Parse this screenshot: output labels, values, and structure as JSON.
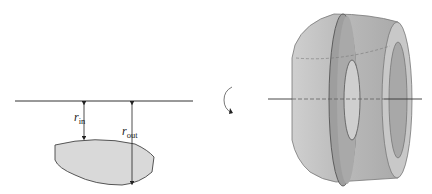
{
  "diagram": {
    "left_panel": {
      "axis": "horizontal axis of rotation",
      "region": "gray lens-shaped region below axis",
      "labels": {
        "r_in": {
          "symbol": "r",
          "subscript": "in"
        },
        "r_out": {
          "symbol": "r",
          "subscript": "out"
        }
      }
    },
    "middle": {
      "icon": "rotation-arrow-icon"
    },
    "right_panel": {
      "solid": "solid of revolution with washer cross-section",
      "axis": "horizontal axis through solid"
    },
    "colors": {
      "region_fill": "#d9d9d9",
      "solid_fill": "#bdbdbd",
      "washer_fill": "#9e9e9e",
      "line": "#333333"
    }
  }
}
